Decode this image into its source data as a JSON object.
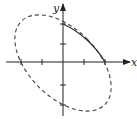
{
  "diagram": {
    "axes": {
      "x_label": "x",
      "y_label": "y",
      "x_ticks": [
        -2,
        -1,
        1,
        2
      ],
      "y_ticks": [
        -2,
        -1,
        1,
        2
      ]
    },
    "curve": {
      "description": "Tilted ellipse x^2 + xy + y^2 = 4, dashed, with solid arc in first quadrant",
      "dashed_color": "#444444",
      "solid_arc": {
        "from": [
          0,
          2
        ],
        "to": [
          2,
          0
        ]
      }
    }
  }
}
